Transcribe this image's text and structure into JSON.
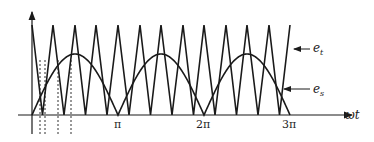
{
  "diagram": {
    "type": "spwm-waveform",
    "axis": {
      "x_label": "ωt",
      "ticks": [
        {
          "label": "π",
          "x": 118
        },
        {
          "label": "2π",
          "x": 204
        },
        {
          "label": "3π",
          "x": 290
        }
      ]
    },
    "labels": {
      "carrier": "e_t",
      "carrier_main": "e",
      "carrier_sub": "t",
      "signal": "e_s",
      "signal_main": "e",
      "signal_sub": "s"
    },
    "geometry": {
      "origin_x": 32,
      "axis_y": 115,
      "axis_top_y": 12,
      "axis_end_x": 352,
      "tri_top_y": 25,
      "half_period_px": 86,
      "sine_peak_y": 54,
      "carrier_peaks_x": [
        32,
        53,
        75,
        96,
        118,
        140,
        161,
        183,
        204,
        226,
        247,
        269,
        290
      ],
      "dashed_lines_x": [
        40,
        45,
        58,
        71
      ]
    },
    "colors": {
      "stroke": "#1a1a1a",
      "background": "#ffffff"
    }
  }
}
